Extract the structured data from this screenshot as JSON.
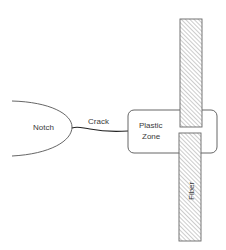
{
  "diagram": {
    "labels": {
      "notch": "Notch",
      "crack": "Crack",
      "plastic_zone_line1": "Plastic",
      "plastic_zone_line2": "Zone",
      "fiber": "Fiber"
    },
    "colors": {
      "stroke": "#555555",
      "hatch": "#9a9a9a",
      "background": "#ffffff",
      "text": "#3a3a3a"
    }
  }
}
